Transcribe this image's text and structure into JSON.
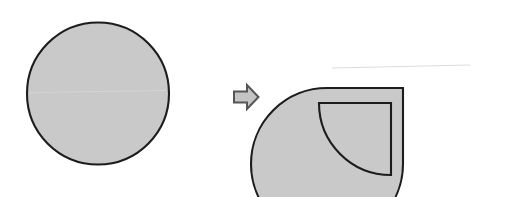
{
  "figure": {
    "title": "Circle divided into a three-quarter sector and a separated quarter sector",
    "background_color": "#ffffff",
    "shape_fill_color": "#c9c9c9",
    "shape_outline_color": "#1c1c1c",
    "arrow_fill_color": "#c4c4c4",
    "arrow_outline_color": "#555555",
    "panels": [
      {
        "id": "before",
        "label": "whole-circle",
        "description": "A complete filled circle",
        "shapes": [
          {
            "name": "whole-circle",
            "type": "circle",
            "center_x": 98,
            "center_y": 93.5,
            "radius": 72
          }
        ]
      },
      {
        "id": "after",
        "label": "split-circle",
        "description": "Circle with one quarter sector cut out and moved down-left",
        "shapes": [
          {
            "name": "three-quarter-sector",
            "type": "sector",
            "center_x": 403,
            "center_y": 88,
            "radius": 76,
            "start_angle_deg": 270,
            "sweep_deg": 270
          },
          {
            "name": "detached-quarter-sector",
            "type": "sector",
            "center_x": 391,
            "center_y": 103,
            "radius": 72,
            "start_angle_deg": 90,
            "sweep_deg": 90
          }
        ]
      }
    ],
    "connector": {
      "name": "transformation-arrow",
      "icon": "arrow-right-icon",
      "direction": "right",
      "x": 233,
      "y": 84,
      "width": 26,
      "height": 26
    }
  }
}
